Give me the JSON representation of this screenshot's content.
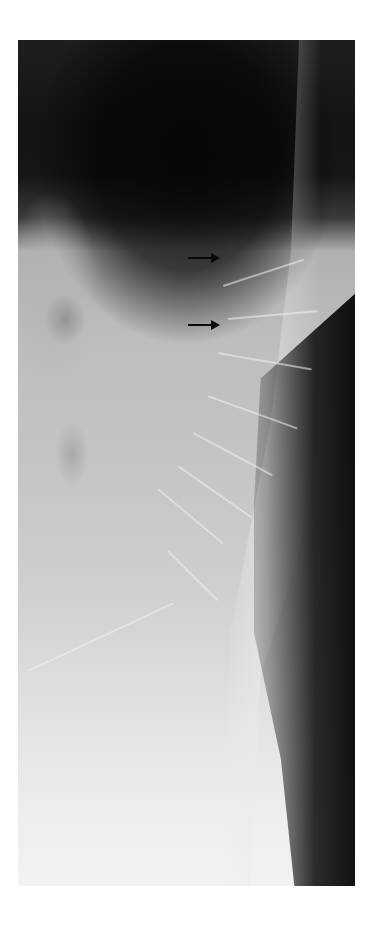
{
  "figure": {
    "type": "lateral spine radiograph",
    "annotations": [
      {
        "name": "arrow-1",
        "direction": "right",
        "x": 188,
        "y": 257
      },
      {
        "name": "arrow-2",
        "direction": "right",
        "x": 188,
        "y": 324
      }
    ],
    "colors": {
      "background": "#ffffff",
      "arrow": "#0a0a0a",
      "dark_region": "#141414",
      "bright_region": "#f2f2f2"
    }
  }
}
